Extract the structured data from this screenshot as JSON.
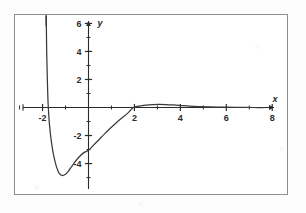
{
  "figure": {
    "background_color": "#ffffff",
    "frame_color": "#8e8e8e",
    "curve_color": "#3a3a3a",
    "axis_color": "#2b2b2b"
  },
  "chart_data": {
    "type": "line",
    "title": "",
    "xlabel": "x",
    "ylabel": "y",
    "grid": false,
    "legend": null,
    "xlim": [
      -3.2,
      8.6
    ],
    "ylim": [
      -6.1,
      6.6
    ],
    "x_ticks_major": [
      -2,
      2,
      4,
      6,
      8
    ],
    "x_tick_labels": [
      "-2",
      "2",
      "4",
      "6",
      "8"
    ],
    "x_ticks_minor": [
      -3,
      -1,
      1,
      3,
      5,
      7
    ],
    "y_ticks_major": [
      -4,
      -2,
      2,
      4,
      6
    ],
    "y_tick_labels": [
      "-4",
      "-2",
      "2",
      "4",
      "6"
    ],
    "y_ticks_minor": [
      -5,
      -3,
      -1,
      1,
      3,
      5
    ],
    "asymptote": {
      "type": "vertical",
      "x": -1.85,
      "note": "curve rises to +infinity just right of x = -2"
    },
    "features": {
      "minimum": {
        "x": -1.15,
        "y": -4.85
      },
      "x_intercept": {
        "x": 1.95,
        "y": 0
      },
      "y_intercept": {
        "x": 0,
        "y": -3.05
      },
      "local_maximum": {
        "x": 3.05,
        "y": 0.22
      },
      "end_behavior": "approaches 0 from above as x increases"
    },
    "series": [
      {
        "name": "curve",
        "points": [
          [
            -1.84,
            6.5
          ],
          [
            -1.83,
            5.2
          ],
          [
            -1.82,
            4.0
          ],
          [
            -1.8,
            2.6
          ],
          [
            -1.78,
            1.3
          ],
          [
            -1.75,
            0.0
          ],
          [
            -1.7,
            -1.2
          ],
          [
            -1.62,
            -2.4
          ],
          [
            -1.52,
            -3.4
          ],
          [
            -1.4,
            -4.2
          ],
          [
            -1.28,
            -4.68
          ],
          [
            -1.15,
            -4.85
          ],
          [
            -1.02,
            -4.78
          ],
          [
            -0.88,
            -4.55
          ],
          [
            -0.72,
            -4.18
          ],
          [
            -0.55,
            -3.8
          ],
          [
            -0.38,
            -3.48
          ],
          [
            -0.2,
            -3.22
          ],
          [
            0.0,
            -3.05
          ],
          [
            0.2,
            -2.72
          ],
          [
            0.45,
            -2.3
          ],
          [
            0.7,
            -1.88
          ],
          [
            0.95,
            -1.48
          ],
          [
            1.2,
            -1.1
          ],
          [
            1.45,
            -0.75
          ],
          [
            1.7,
            -0.42
          ],
          [
            1.95,
            0.0
          ],
          [
            2.2,
            0.1
          ],
          [
            2.5,
            0.17
          ],
          [
            2.8,
            0.21
          ],
          [
            3.05,
            0.22
          ],
          [
            3.35,
            0.21
          ],
          [
            3.7,
            0.18
          ],
          [
            4.05,
            0.14
          ],
          [
            4.4,
            0.1
          ],
          [
            4.8,
            0.07
          ],
          [
            5.2,
            0.05
          ],
          [
            5.6,
            0.03
          ],
          [
            6.0,
            0.02
          ],
          [
            6.6,
            0.01
          ],
          [
            7.2,
            0.0
          ],
          [
            7.6,
            0.0
          ]
        ]
      }
    ]
  }
}
